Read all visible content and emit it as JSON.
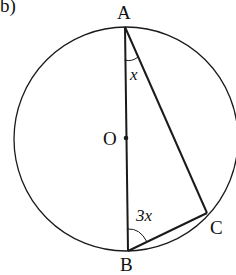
{
  "part_label": "b)",
  "points": {
    "A": {
      "label": "A",
      "x": 125,
      "y": 27
    },
    "B": {
      "label": "B",
      "x": 128,
      "y": 251
    },
    "C": {
      "label": "C",
      "x": 207,
      "y": 213
    },
    "O": {
      "label": "O",
      "x": 126,
      "y": 138
    }
  },
  "circle": {
    "cx": 126,
    "cy": 139,
    "r": 112
  },
  "angles": {
    "A": {
      "label": "x"
    },
    "B": {
      "label": "3x"
    }
  },
  "colors": {
    "stroke": "#1a1a1a",
    "background": "#ffffff"
  }
}
